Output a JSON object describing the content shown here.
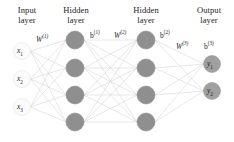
{
  "diagram": {
    "background_color": "#ffffff",
    "layer_titles": [
      {
        "id": "input",
        "text": "Input\nlayer",
        "x": 5,
        "y": 6,
        "width": 44
      },
      {
        "id": "hidden1",
        "text": "Hidden\nlayer",
        "x": 52,
        "y": 6,
        "width": 48
      },
      {
        "id": "hidden2",
        "text": "Hidden\nlayer",
        "x": 122,
        "y": 6,
        "width": 48
      },
      {
        "id": "output",
        "text": "Output\nlayer",
        "x": 186,
        "y": 6,
        "width": 46
      }
    ],
    "param_labels": [
      {
        "id": "w1",
        "base": "W",
        "sup": "(1)",
        "x": 36,
        "y": 33,
        "italic": true
      },
      {
        "id": "b1",
        "base": "b",
        "sup": "(1)",
        "x": 90,
        "y": 29,
        "italic": false
      },
      {
        "id": "w2",
        "base": "W",
        "sup": "(2)",
        "x": 114,
        "y": 29,
        "italic": true
      },
      {
        "id": "b2",
        "base": "b",
        "sup": "(2)",
        "x": 160,
        "y": 29,
        "italic": false
      },
      {
        "id": "w3",
        "base": "W",
        "sup": "(3)",
        "x": 176,
        "y": 40,
        "italic": true
      },
      {
        "id": "b3",
        "base": "b",
        "sup": "(3)",
        "x": 204,
        "y": 40,
        "italic": false
      }
    ],
    "layers": [
      {
        "id": "input-layer",
        "name": "Input layer",
        "cx": 22,
        "node_radius": 8.5,
        "fill": "#fbfbfb",
        "stroke": "#e2e2e2",
        "label_color": "#1b1b1b",
        "nodes": [
          {
            "id": "x1",
            "base": "x",
            "sub": "1",
            "cy": 51
          },
          {
            "id": "x2",
            "base": "x",
            "sub": "2",
            "cy": 79
          },
          {
            "id": "x3",
            "base": "x",
            "sub": "3",
            "cy": 107
          }
        ]
      },
      {
        "id": "hidden-layer-1",
        "name": "Hidden layer 1",
        "cx": 75,
        "node_radius": 9,
        "fill": "#8f8f8f",
        "stroke": "#8f8f8f",
        "label_color": "",
        "nodes": [
          {
            "id": "h1_1",
            "base": "",
            "sub": "",
            "cy": 40
          },
          {
            "id": "h1_2",
            "base": "",
            "sub": "",
            "cy": 68
          },
          {
            "id": "h1_3",
            "base": "",
            "sub": "",
            "cy": 95
          },
          {
            "id": "h1_4",
            "base": "",
            "sub": "",
            "cy": 122
          }
        ]
      },
      {
        "id": "hidden-layer-2",
        "name": "Hidden layer 2",
        "cx": 146,
        "node_radius": 9,
        "fill": "#8f8f8f",
        "stroke": "#8f8f8f",
        "label_color": "",
        "nodes": [
          {
            "id": "h2_1",
            "base": "",
            "sub": "",
            "cy": 40
          },
          {
            "id": "h2_2",
            "base": "",
            "sub": "",
            "cy": 68
          },
          {
            "id": "h2_3",
            "base": "",
            "sub": "",
            "cy": 95
          },
          {
            "id": "h2_4",
            "base": "",
            "sub": "",
            "cy": 122
          }
        ]
      },
      {
        "id": "output-layer",
        "name": "Output layer",
        "cx": 212,
        "node_radius": 8.5,
        "fill": "#a0a0a0",
        "stroke": "#9a9a9a",
        "label_color": "#1b1b1b",
        "nodes": [
          {
            "id": "y1",
            "base": "y",
            "sub": "1",
            "cy": 64
          },
          {
            "id": "y2",
            "base": "y",
            "sub": "2",
            "cy": 91
          }
        ]
      }
    ],
    "edges": {
      "color": "#cfcfcf",
      "width": 0.5,
      "connections": [
        {
          "from": "input-layer",
          "to": "hidden-layer-1"
        },
        {
          "from": "hidden-layer-1",
          "to": "hidden-layer-2"
        },
        {
          "from": "hidden-layer-2",
          "to": "output-layer"
        }
      ]
    }
  }
}
